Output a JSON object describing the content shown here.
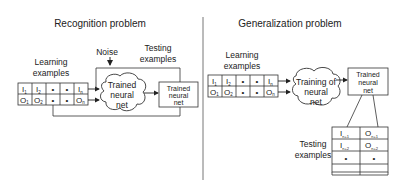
{
  "left_panel": {
    "title": "Recognition problem",
    "learning_label_line1": "Learning",
    "learning_label_line2": "examples",
    "noise_label": "Noise",
    "testing_label_line1": "Testing",
    "testing_label_line2": "examples",
    "table": {
      "row_inputs": [
        "I",
        "I",
        "•",
        "•",
        "I"
      ],
      "row_inputs_sub": [
        "1",
        "2",
        "",
        "",
        "n"
      ],
      "row_outputs": [
        "O",
        "O",
        "•",
        "•",
        "O"
      ],
      "row_outputs_sub": [
        "1",
        "2",
        "",
        "",
        "n"
      ]
    },
    "cloud_line1": "Trained",
    "cloud_line2": "neural",
    "cloud_line3": "net",
    "box_line1": "Trained",
    "box_line2": "neural",
    "box_line3": "net"
  },
  "right_panel": {
    "title": "Generalization problem",
    "learning_label_line1": "Learning",
    "learning_label_line2": "examples",
    "table": {
      "row_inputs": [
        "I",
        "I",
        "•",
        "•",
        "I"
      ],
      "row_inputs_sub": [
        "1",
        "2",
        "",
        "",
        "n"
      ],
      "row_outputs": [
        "O",
        "O",
        "•",
        "•",
        "O"
      ],
      "row_outputs_sub": [
        "1",
        "2",
        "",
        "",
        "n"
      ]
    },
    "cloud_line1": "Training of",
    "cloud_line2": "neural",
    "cloud_line3": "net",
    "box_line1": "Trained",
    "box_line2": "neural",
    "box_line3": "net",
    "testing_label_line1": "Testing",
    "testing_label_line2": "examples",
    "test_table": {
      "col1": [
        "I",
        "I",
        "•",
        ""
      ],
      "col1_sub": [
        "n+1",
        "n+2",
        "",
        ""
      ],
      "col2": [
        "O",
        "O",
        "•",
        ""
      ],
      "col2_sub": [
        "n+1",
        "n+2",
        "",
        ""
      ]
    }
  }
}
